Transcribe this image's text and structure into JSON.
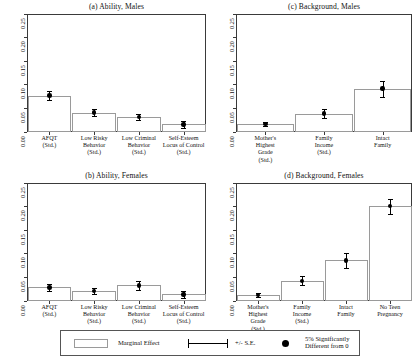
{
  "figure": {
    "background": "#ffffff",
    "foreground": "#111111"
  },
  "legend": {
    "marginal_effect_label": "Marginal Effect",
    "se_label": "+/- S.E.",
    "significance_label": "5% Significantly\nDifferent from 0"
  },
  "axis": {
    "yticks": [
      "0.00",
      "0.05",
      "0.10",
      "0.15",
      "0.20",
      "0.25"
    ],
    "ylim": [
      0.0,
      0.25
    ]
  },
  "chart_data": [
    {
      "type": "bar",
      "panel": "a",
      "title": "(a) Ability, Males",
      "xlabel": "",
      "ylabel": "",
      "ylim": [
        0.0,
        0.25
      ],
      "yticks": [
        0.0,
        0.05,
        0.1,
        0.15,
        0.2,
        0.25
      ],
      "grid": false,
      "legend_position": "below-figure",
      "categories": [
        "AFQT\n(Std.)",
        "Low Risky\nBehavior\n(Std.)",
        "Low Criminal\nBehavior\n(Std.)",
        "Self-Esteem\nLocus of Control\n(Std.)"
      ],
      "values": [
        0.077,
        0.041,
        0.032,
        0.016
      ],
      "errors": [
        0.009,
        0.007,
        0.007,
        0.008
      ],
      "significant": [
        true,
        true,
        true,
        true
      ]
    },
    {
      "type": "bar",
      "panel": "b",
      "title": "(b) Ability, Females",
      "xlabel": "",
      "ylabel": "",
      "ylim": [
        0.0,
        0.25
      ],
      "yticks": [
        0.0,
        0.05,
        0.1,
        0.15,
        0.2,
        0.25
      ],
      "grid": false,
      "legend_position": "below-figure",
      "categories": [
        "AFQT\n(Std.)",
        "Low Risky\nBehavior\n(Std.)",
        "Low Criminal\nBehavior\n(Std.)",
        "Self-Esteem\nLocus of Control\n(Std.)"
      ],
      "values": [
        0.029,
        0.021,
        0.033,
        0.014
      ],
      "errors": [
        0.008,
        0.006,
        0.009,
        0.007
      ],
      "significant": [
        true,
        true,
        true,
        true
      ]
    },
    {
      "type": "bar",
      "panel": "c",
      "title": "(c) Background, Males",
      "xlabel": "",
      "ylabel": "",
      "ylim": [
        0.0,
        0.25
      ],
      "yticks": [
        0.0,
        0.05,
        0.1,
        0.15,
        0.2,
        0.25
      ],
      "grid": false,
      "legend_position": "below-figure",
      "categories": [
        "Mother's\nHighest\nGrade\n(Std.)",
        "Family\nIncome\n(Std.)",
        "Intact\nFamily"
      ],
      "values": [
        0.017,
        0.039,
        0.092
      ],
      "errors": [
        0.004,
        0.009,
        0.017
      ],
      "significant": [
        true,
        true,
        true
      ]
    },
    {
      "type": "bar",
      "panel": "d",
      "title": "(d) Background, Females",
      "xlabel": "",
      "ylabel": "",
      "ylim": [
        0.0,
        0.25
      ],
      "yticks": [
        0.0,
        0.05,
        0.1,
        0.15,
        0.2,
        0.25
      ],
      "grid": false,
      "legend_position": "below-figure",
      "categories": [
        "Mother's\nHighest\nGrade\n(Std.)",
        "Family\nIncome\n(Std.)",
        "Intact\nFamily",
        "No Teen\nPregnancy"
      ],
      "values": [
        0.013,
        0.043,
        0.086,
        0.201
      ],
      "errors": [
        0.004,
        0.01,
        0.016,
        0.016
      ],
      "significant": [
        true,
        true,
        true,
        true
      ]
    }
  ]
}
